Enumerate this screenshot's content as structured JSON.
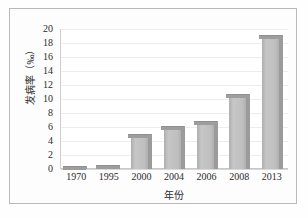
{
  "chart_data": {
    "type": "bar",
    "title": "",
    "xlabel": "年份",
    "ylabel": "发病率（‰）",
    "categories": [
      "1970",
      "1995",
      "2000",
      "2004",
      "2006",
      "2008",
      "2013"
    ],
    "values": [
      0.5,
      0.6,
      5.0,
      6.2,
      6.8,
      10.7,
      19.2
    ],
    "ylim": [
      0,
      20
    ],
    "ytick_labels": [
      "20",
      "18",
      "16",
      "14",
      "12",
      "10",
      "8",
      "6",
      "4",
      "2",
      "0"
    ],
    "ytick_values": [
      20,
      18,
      16,
      14,
      12,
      10,
      8,
      6,
      4,
      2,
      0
    ],
    "ystep": 2,
    "grid": true,
    "legend": "none",
    "series": [
      {
        "name": "发病率",
        "values": [
          0.5,
          0.6,
          5.0,
          6.2,
          6.8,
          10.7,
          19.2
        ]
      }
    ],
    "style": {
      "bar_fill": "#bfbfbf",
      "bar_top": "#9d9d9d",
      "bar_side": "#9b9b9b",
      "grid_color": "#ededed",
      "axis_color": "#c7c7c7",
      "text_color": "#2b2b2b",
      "frame_color": "#b9b9b9",
      "background": "#ffffff",
      "three_d": true
    }
  }
}
